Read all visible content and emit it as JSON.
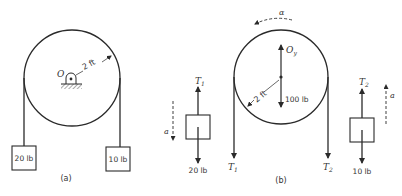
{
  "panel_a": {
    "caption": "(a)",
    "pivot_label": "O",
    "radius_label": "2 ft",
    "left_mass_label": "20 lb",
    "right_mass_label": "10 lb"
  },
  "fbd_left": {
    "tension_label": "T",
    "tension_sub": "1",
    "weight_label": "20 lb",
    "accel_label": "a"
  },
  "panel_b": {
    "caption": "(b)",
    "alpha_label": "α",
    "reaction_label": "O",
    "reaction_sub": "y",
    "radius_label": "2 ft",
    "weight_label": "100 lb",
    "left_tension_label": "T",
    "left_tension_sub": "1",
    "right_tension_label": "T",
    "right_tension_sub": "2"
  },
  "fbd_right": {
    "tension_label": "T",
    "tension_sub": "2",
    "weight_label": "10 lb",
    "accel_label": "a"
  },
  "colors": {
    "stroke": "#2a2a2a",
    "text": "#333333"
  }
}
